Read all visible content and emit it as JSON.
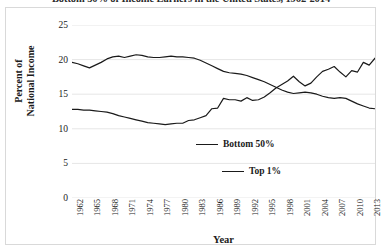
{
  "caption": "Bottom 50% of Income Earners in the United States, 1962-2014",
  "chart_data": {
    "type": "line",
    "title": "Bottom 50% of Income Earners in the United States, 1962-2014",
    "xlabel": "Year",
    "ylabel": "Percent of National Income",
    "ylim": [
      0,
      25
    ],
    "xlim": [
      1962,
      2014
    ],
    "yticks": [
      "0",
      "5",
      "10",
      "15",
      "20",
      "25"
    ],
    "ytick_values": [
      0,
      5,
      10,
      15,
      20,
      25
    ],
    "xticks": [
      "1962",
      "1965",
      "1968",
      "1971",
      "1974",
      "1977",
      "1980",
      "1983",
      "1986",
      "1989",
      "1992",
      "1995",
      "1998",
      "2001",
      "2004",
      "2007",
      "2010",
      "2013"
    ],
    "xtick_values": [
      1962,
      1965,
      1968,
      1971,
      1974,
      1977,
      1980,
      1983,
      1986,
      1989,
      1992,
      1995,
      1998,
      2001,
      2004,
      2007,
      2010,
      2013
    ],
    "grid": "horizontal",
    "legend_position": "inside-lower-right",
    "line_color": "#1a1a1a",
    "grid_color": "#e6e6e6",
    "x": [
      1962,
      1963,
      1964,
      1965,
      1966,
      1967,
      1968,
      1969,
      1970,
      1971,
      1972,
      1973,
      1974,
      1975,
      1976,
      1977,
      1978,
      1979,
      1980,
      1981,
      1982,
      1983,
      1984,
      1985,
      1986,
      1987,
      1988,
      1989,
      1990,
      1991,
      1992,
      1993,
      1994,
      1995,
      1996,
      1997,
      1998,
      1999,
      2000,
      2001,
      2002,
      2003,
      2004,
      2005,
      2006,
      2007,
      2008,
      2009,
      2010,
      2011,
      2012,
      2013,
      2014
    ],
    "series": [
      {
        "name": "Bottom 50%",
        "values": [
          19.6,
          19.4,
          19.1,
          18.8,
          19.2,
          19.6,
          20.1,
          20.4,
          20.5,
          20.3,
          20.5,
          20.7,
          20.6,
          20.4,
          20.3,
          20.3,
          20.4,
          20.5,
          20.4,
          20.4,
          20.3,
          20.2,
          19.9,
          19.5,
          19.1,
          18.7,
          18.3,
          18.1,
          18.0,
          17.9,
          17.7,
          17.4,
          17.1,
          16.8,
          16.4,
          16.0,
          15.6,
          15.3,
          15.1,
          15.2,
          15.3,
          15.2,
          15.0,
          14.7,
          14.5,
          14.4,
          14.5,
          14.4,
          14.0,
          13.6,
          13.3,
          13.0,
          12.9
        ]
      },
      {
        "name": "Top 1%",
        "values": [
          12.8,
          12.8,
          12.7,
          12.7,
          12.6,
          12.5,
          12.4,
          12.2,
          11.9,
          11.7,
          11.5,
          11.3,
          11.1,
          10.9,
          10.8,
          10.7,
          10.6,
          10.7,
          10.8,
          10.8,
          11.2,
          11.3,
          11.6,
          11.9,
          12.9,
          13.0,
          14.4,
          14.2,
          14.2,
          14.0,
          14.5,
          14.1,
          14.2,
          14.6,
          15.2,
          15.9,
          16.4,
          16.9,
          17.6,
          16.8,
          16.2,
          16.6,
          17.5,
          18.3,
          18.6,
          19.0,
          18.2,
          17.5,
          18.4,
          18.2,
          19.6,
          19.2,
          20.2
        ]
      }
    ]
  },
  "legend": {
    "entries": [
      {
        "label": "Bottom 50%"
      },
      {
        "label": "Top 1%"
      }
    ]
  }
}
